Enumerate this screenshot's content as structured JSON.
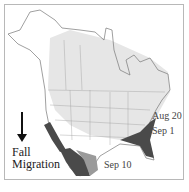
{
  "map": {
    "title_line1": "Fall",
    "title_line2": "Migration",
    "direction_icon": "arrow-down-icon",
    "dates": [
      {
        "label": "Aug 20"
      },
      {
        "label": "Sep 1"
      },
      {
        "label": "Sep 10"
      }
    ],
    "colors": {
      "range_light": "#e6e6e6",
      "range_medium": "#9a9a9a",
      "range_dark": "#4a4a4a",
      "outline": "#777777"
    }
  }
}
